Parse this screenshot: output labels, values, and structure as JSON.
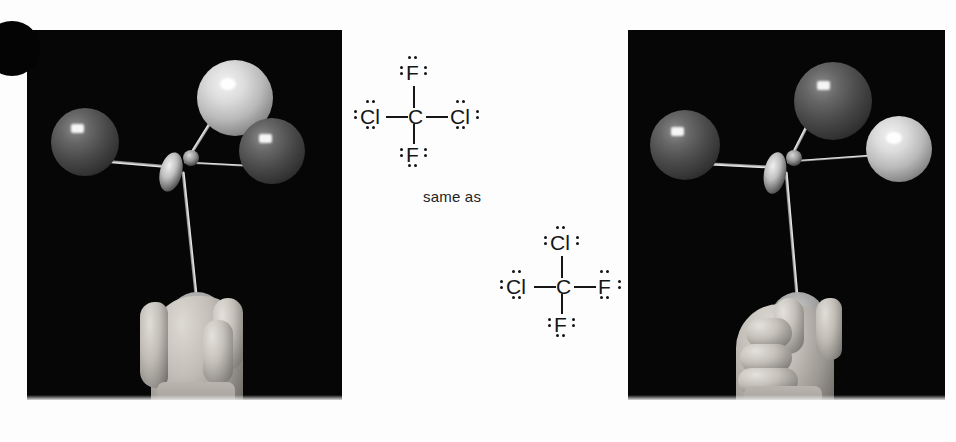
{
  "figure": {
    "kind": "chemistry-textbook-figure",
    "caption_text": "same as",
    "connector_label": "same as"
  },
  "photos": [
    {
      "id": "photo-left",
      "name": "ball-and-stick-model-photo-left",
      "description": "Ball-and-stick molecular model of CCl2F2 held in a hand against a black background",
      "atoms": [
        {
          "label": "Cl",
          "shade": "dark",
          "position": "upper-left"
        },
        {
          "label": "F",
          "shade": "light",
          "position": "top"
        },
        {
          "label": "Cl",
          "shade": "dark",
          "position": "upper-right"
        },
        {
          "label": "F",
          "shade": "held",
          "position": "bottom-in-hand"
        }
      ]
    },
    {
      "id": "photo-right",
      "name": "ball-and-stick-model-photo-right",
      "description": "Same molecular model rotated, showing an alternate orientation",
      "atoms": [
        {
          "label": "Cl",
          "shade": "dark",
          "position": "upper-left"
        },
        {
          "label": "Cl",
          "shade": "dark",
          "position": "top"
        },
        {
          "label": "F",
          "shade": "light",
          "position": "upper-right"
        },
        {
          "label": "F",
          "shade": "held",
          "position": "bottom-in-hand"
        }
      ]
    }
  ],
  "lewis_structures": [
    {
      "id": "lewis-1",
      "name": "lewis-structure-top",
      "center": "C",
      "top": "F",
      "left": "Cl",
      "right": "Cl",
      "bottom": "F",
      "formula": "CCl2F2",
      "lone_pairs_per_halogen": 3
    },
    {
      "id": "lewis-2",
      "name": "lewis-structure-bottom",
      "center": "C",
      "top": "Cl",
      "left": "Cl",
      "right": "F",
      "bottom": "F",
      "formula": "CCl2F2",
      "lone_pairs_per_halogen": 3
    }
  ],
  "colors": {
    "background": "#ffffff",
    "photo_background": "#060606",
    "ink": "#161616",
    "light_sphere": "#dcdcdc",
    "dark_sphere": "#4a4a4a"
  }
}
